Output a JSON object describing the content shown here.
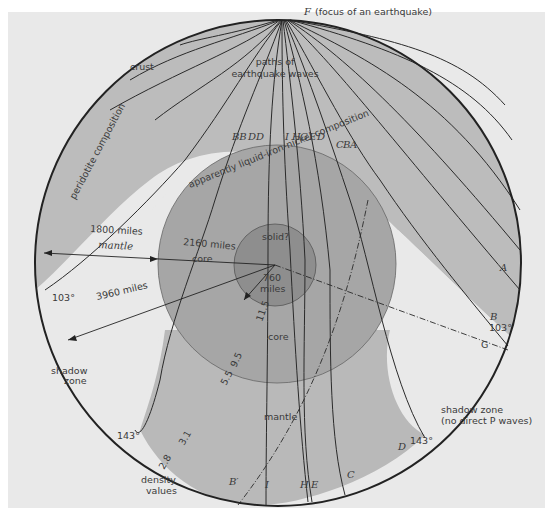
{
  "title": "F (focus of an earthquake)",
  "labels": {
    "focus_letter": "F",
    "focus_text": "(focus of an earthquake)",
    "paths_1": "paths of",
    "paths_2": "earthquake waves",
    "crust": "crust",
    "peridotite": "peridotite composition",
    "liquid_core": "apparently liquid-iron-nickel composition",
    "solid": "solid?",
    "miles_1800": "1800 miles",
    "mantle_top": "mantle",
    "miles_2160": "2160 miles",
    "core_left": "core",
    "miles_3960": "3960 miles",
    "miles_760_a": "760",
    "miles_760_b": "miles",
    "core_center": "core",
    "mantle_bottom": "mantle",
    "shadow_left_1": "shadow",
    "shadow_left_2": "zone",
    "shadow_right_1": "shadow zone",
    "shadow_right_2": "(no direct P waves)",
    "density_1": "density",
    "density_2": "values",
    "angle_103_left": "103°",
    "angle_103_right": "103°",
    "angle_143_left": "143°",
    "angle_143_right": "143°"
  },
  "density_values": [
    "2.8",
    "3.1",
    "5.5",
    "9.5",
    "11.5"
  ],
  "ray_labels_top": [
    "BB",
    "DD",
    "I",
    "H",
    "G",
    "E",
    "D",
    "C",
    "B",
    "A"
  ],
  "ray_labels_surface": {
    "A": "A",
    "B": "B",
    "G": "G",
    "D": "D",
    "C": "C",
    "E": "E",
    "H": "H",
    "I": "I",
    "B_prime": "B′"
  },
  "colors": {
    "background": "#e9e9e9",
    "mantle_wave": "#b9b9b9",
    "core_outer": "#a9a9a9",
    "core_inner": "#949494",
    "shadow": "#e9e9e9",
    "line": "#2a2a2a"
  }
}
